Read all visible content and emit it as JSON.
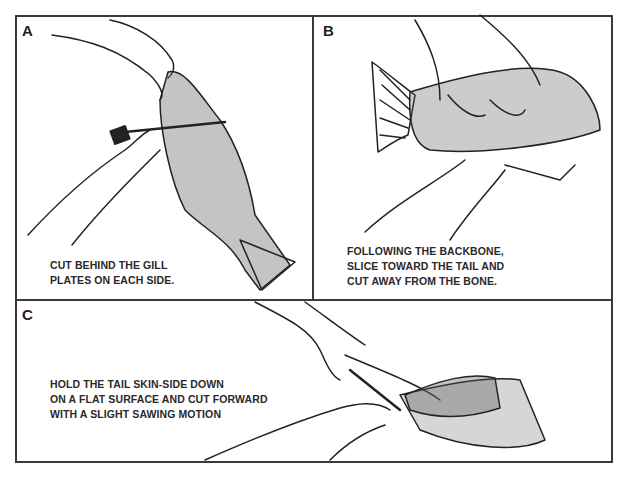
{
  "figure": {
    "colors": {
      "ink": "#222222",
      "border": "#3a3a3a",
      "background": "#ffffff"
    }
  },
  "panels": [
    {
      "label": "A",
      "caption_lines": [
        "CUT BEHIND THE GILL",
        "PLATES ON EACH SIDE."
      ],
      "illustration": "hand holding fish by mouth while other hand cuts behind gill plate with knife"
    },
    {
      "label": "B",
      "caption_lines": [
        "FOLLOWING THE BACKBONE,",
        "SLICE TOWARD THE TAIL AND",
        "CUT AWAY FROM THE BONE."
      ],
      "illustration": "hand pressing fish on side while knife slices along backbone toward tail"
    },
    {
      "label": "C",
      "caption_lines": [
        "HOLD THE TAIL SKIN-SIDE DOWN",
        "ON A FLAT SURFACE AND CUT FORWARD",
        "WITH A SLIGHT SAWING MOTION"
      ],
      "illustration": "hand holding fillet tail skin-side down while knife cuts forward separating skin"
    }
  ]
}
